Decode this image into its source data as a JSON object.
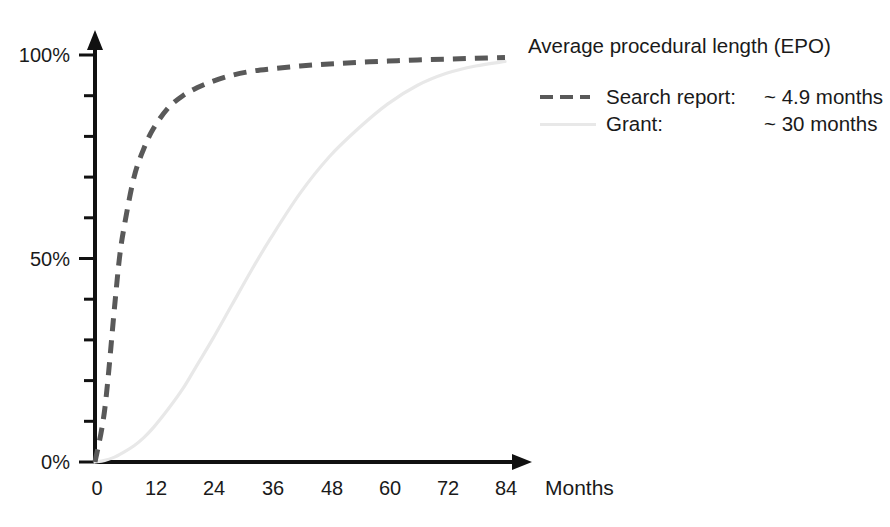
{
  "chart_data": {
    "type": "line",
    "title": "Average procedural length (EPO)",
    "xlabel": "Months",
    "ylabel": "",
    "xlim": [
      0,
      84
    ],
    "ylim": [
      0,
      100
    ],
    "grid": false,
    "legend_position": "top-right",
    "x_tick_labels": [
      "0",
      "12",
      "24",
      "36",
      "48",
      "60",
      "72",
      "84"
    ],
    "x_tick_values": [
      0,
      12,
      24,
      36,
      48,
      60,
      72,
      84
    ],
    "y_tick_labels": [
      "0%",
      "50%",
      "100%"
    ],
    "y_tick_values": [
      0,
      50,
      100
    ],
    "y_minor_tick_values": [
      10,
      20,
      30,
      40,
      60,
      70,
      80,
      90
    ],
    "x": [
      0,
      2,
      4,
      5,
      6,
      8,
      10,
      12,
      15,
      18,
      21,
      24,
      28,
      32,
      36,
      42,
      48,
      54,
      60,
      66,
      72,
      78,
      84
    ],
    "series": [
      {
        "name": "Search report",
        "style": "dashed",
        "color": "#595959",
        "values": [
          0,
          13,
          38,
          50,
          58,
          70,
          77,
          82,
          87,
          90,
          92,
          93.5,
          95,
          96,
          96.6,
          97.3,
          97.8,
          98.2,
          98.5,
          98.8,
          99,
          99.2,
          99.4
        ]
      },
      {
        "name": "Grant",
        "style": "solid",
        "color": "#e8e8e8",
        "values": [
          0,
          0.4,
          1.2,
          1.8,
          2.5,
          4,
          6,
          8.5,
          13,
          18,
          24,
          30,
          38.5,
          47,
          55,
          66,
          75,
          82,
          88,
          92.5,
          95.5,
          97.3,
          98.4
        ]
      }
    ],
    "legend": {
      "title": "Average procedural length (EPO)",
      "entries": [
        {
          "swatch": "dashed-line-swatch",
          "name": "Search report:",
          "value": "~ 4.9 months",
          "color": "#595959"
        },
        {
          "swatch": "solid-line-swatch",
          "name": "Grant:",
          "value": "~ 30 months",
          "color": "#e8e8e8"
        }
      ]
    },
    "colors": {
      "axis": "#111111",
      "search_report": "#595959",
      "grant": "#e8e8e8",
      "background": "#ffffff",
      "text": "#1a1a1a"
    }
  }
}
